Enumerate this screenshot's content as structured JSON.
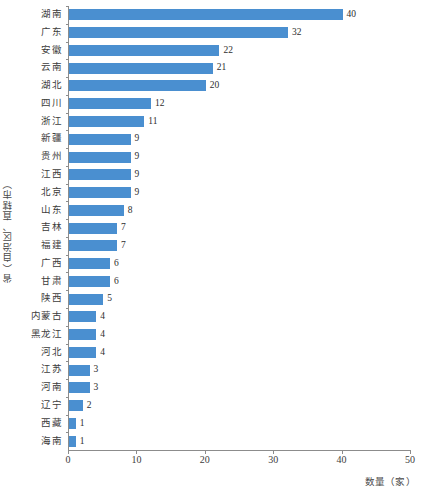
{
  "chart_data": {
    "type": "bar",
    "orientation": "horizontal",
    "title": "",
    "xlabel": "数量（家）",
    "ylabel": "省（自治区、直辖市）",
    "xlim": [
      0,
      50
    ],
    "xticks": [
      0,
      10,
      20,
      30,
      40,
      50
    ],
    "xtick_labels": [
      "0",
      "10",
      "20",
      "30",
      "40",
      "50"
    ],
    "grid": false,
    "legend": null,
    "bar_color": "#4a8fd0",
    "axis_color": "#8c8c8c",
    "label_color": "#3c3c3c",
    "categories": [
      "湖南",
      "广东",
      "安徽",
      "云南",
      "湖北",
      "四川",
      "浙江",
      "新疆",
      "贵州",
      "江西",
      "北京",
      "山东",
      "吉林",
      "福建",
      "广西",
      "甘肃",
      "陕西",
      "内蒙古",
      "黑龙江",
      "河北",
      "江苏",
      "河南",
      "辽宁",
      "西藏",
      "海南"
    ],
    "values": [
      40,
      32,
      22,
      21,
      20,
      12,
      11,
      9,
      9,
      9,
      9,
      8,
      7,
      7,
      6,
      6,
      5,
      4,
      4,
      4,
      3,
      3,
      2,
      1,
      1
    ],
    "value_labels": [
      "40",
      "32",
      "22",
      "21",
      "20",
      "12",
      "11",
      "9",
      "9",
      "9",
      "9",
      "8",
      "7",
      "7",
      "6",
      "6",
      "5",
      "4",
      "4",
      "4",
      "3",
      "3",
      "2",
      "1",
      "1"
    ]
  }
}
